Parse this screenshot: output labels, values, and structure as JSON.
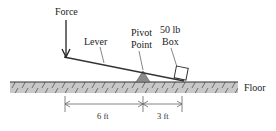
{
  "diagram": {
    "labels": {
      "force": "Force",
      "lever": "Lever",
      "pivot_line1": "Pivot",
      "pivot_line2": "Point",
      "box_line1": "50 lb",
      "box_line2": "Box",
      "floor": "Floor"
    },
    "dimensions": {
      "left": "6 ft",
      "right": "3 ft"
    },
    "colors": {
      "floor_fill": "#c8c8c8",
      "pivot_fill": "#8a8a8a",
      "line": "#333333",
      "dimension_line": "#666666"
    }
  }
}
